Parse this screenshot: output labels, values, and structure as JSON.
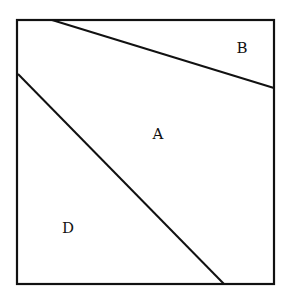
{
  "diagram": {
    "type": "partitioned-square",
    "stroke_color": "#111111",
    "background": "#ffffff",
    "outer_square": {
      "x1": 17,
      "y1": 20,
      "x2": 274,
      "y2": 284
    },
    "lines": [
      {
        "name": "upper-dividing-line",
        "x1": 52,
        "y1": 20,
        "x2": 274,
        "y2": 88
      },
      {
        "name": "lower-dividing-line",
        "x1": 18,
        "y1": 74,
        "x2": 224,
        "y2": 284
      }
    ],
    "regions": [
      {
        "label": "B",
        "x": 242,
        "y": 53
      },
      {
        "label": "A",
        "x": 158,
        "y": 139
      },
      {
        "label": "D",
        "x": 68,
        "y": 233
      }
    ]
  }
}
